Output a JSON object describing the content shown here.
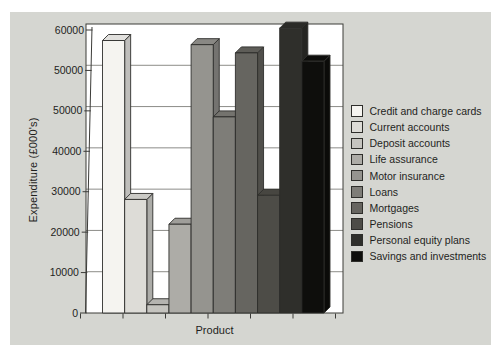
{
  "page": {
    "background": "#ffffff",
    "panel_background": "#d5d6d1",
    "text_color": "#1f1f1d"
  },
  "chart_data": {
    "type": "bar",
    "style": "3d-column",
    "title": "",
    "xlabel": "Product",
    "ylabel": "Expenditure (£000's)",
    "categories": [
      "Credit and charge cards",
      "Current accounts",
      "Deposit accounts",
      "Life assurance",
      "Motor insurance",
      "Loans",
      "Mortgages",
      "Pensions",
      "Personal equity plans",
      "Savings and investments"
    ],
    "values": [
      58000,
      27500,
      2000,
      21500,
      57500,
      47500,
      56500,
      28500,
      59500,
      55500
    ],
    "colors": [
      "#f5f4f0",
      "#dddcd7",
      "#c5c4bf",
      "#adaca7",
      "#95948f",
      "#7e7d78",
      "#666560",
      "#4d4c47",
      "#2f2f2b",
      "#0e0e0c"
    ],
    "ylim": [
      0,
      60000
    ],
    "ytick_labels_top_to_bottom": [
      "60000",
      "50000",
      "50000",
      "40000",
      "30000",
      "20000",
      "10000",
      "0"
    ],
    "grid": true,
    "legend_position": "right",
    "plot_background": "#ffffff",
    "axis_color": "#3c3c39",
    "gridline_color": "#6e6e6a"
  }
}
